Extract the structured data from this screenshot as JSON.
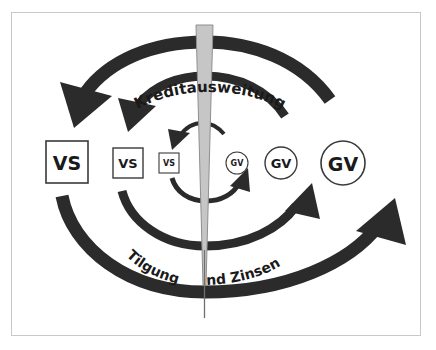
{
  "figure": {
    "frame_color": "#c9c9c9",
    "background": "#ffffff",
    "arrow_color": "#2b2b2b",
    "wedge_color": "#c6c6c6",
    "wedge_stroke": "#8f8f8f",
    "node_stroke": "#3a3a3a",
    "text_color": "#1a1a1a"
  },
  "labels": {
    "top_arc": "Kreditausweitung",
    "bottom_arc_left": "Tilgung",
    "bottom_arc_right": "und Zinsen"
  },
  "nodes": {
    "left_side": [
      {
        "name": "vs-large",
        "text": "VS",
        "shape": "square",
        "cx": 67,
        "cy": 162,
        "size": 42,
        "font_size": 19
      },
      {
        "name": "vs-medium",
        "text": "VS",
        "shape": "square",
        "cx": 128,
        "cy": 163,
        "size": 30,
        "font_size": 13
      },
      {
        "name": "vs-small",
        "text": "VS",
        "shape": "square",
        "cx": 169,
        "cy": 163,
        "size": 20,
        "font_size": 8
      }
    ],
    "right_side": [
      {
        "name": "gv-small",
        "text": "GV",
        "shape": "circle",
        "cx": 237,
        "cy": 163,
        "size": 22,
        "font_size": 8
      },
      {
        "name": "gv-medium",
        "text": "GV",
        "shape": "circle",
        "cx": 281,
        "cy": 163,
        "size": 32,
        "font_size": 13
      },
      {
        "name": "gv-large",
        "text": "GV",
        "shape": "circle",
        "cx": 343,
        "cy": 163,
        "size": 44,
        "font_size": 19
      }
    ]
  },
  "arrows": {
    "outer_top": {
      "name": "outer-credit-expansion-arrow",
      "direction": "right-to-left",
      "meaning": "Kreditausweitung"
    },
    "outer_bottom": {
      "name": "outer-repayment-arrow",
      "direction": "left-to-right",
      "meaning": "Tilgung und Zinsen"
    },
    "middle_top": {
      "name": "middle-credit-expansion-arrow",
      "direction": "right-to-left"
    },
    "middle_bottom": {
      "name": "middle-repayment-arrow",
      "direction": "left-to-right"
    },
    "inner_top": {
      "name": "inner-credit-expansion-arrow",
      "direction": "right-to-left"
    },
    "inner_bottom": {
      "name": "inner-repayment-arrow",
      "direction": "left-to-right"
    }
  },
  "wedge": {
    "name": "growth-wedge",
    "top_width": 17,
    "top_y": 25,
    "tip_y": 285,
    "tail_y": 318,
    "center_x": 205
  }
}
